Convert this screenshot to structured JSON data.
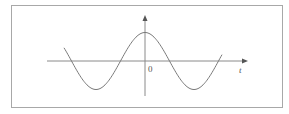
{
  "figure": {
    "type": "function-plot",
    "function": "cosine",
    "axes": {
      "x_label": "t",
      "origin_label": "0"
    },
    "colors": {
      "frame": "#a8a8a8",
      "axis": "#8a8a8a",
      "curve": "#7a7a7a",
      "text": "#555555"
    }
  }
}
